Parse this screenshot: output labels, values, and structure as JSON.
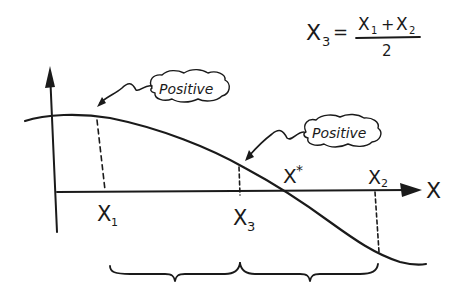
{
  "diagram": {
    "formula": {
      "lhs": "X",
      "lhs_sub": "3",
      "equals": "=",
      "numerator_a": "X",
      "numerator_a_sub": "1",
      "plus": "+",
      "numerator_b": "X",
      "numerator_b_sub": "2",
      "denominator": "2"
    },
    "axis": {
      "x_label": "X"
    },
    "points": {
      "x1": {
        "label": "X",
        "sub": "1"
      },
      "x3": {
        "label": "X",
        "sub": "3"
      },
      "x2": {
        "label": "X",
        "sub": "2"
      },
      "root": {
        "label": "X",
        "sup": "*"
      }
    },
    "callouts": [
      {
        "text": "Positive",
        "target": "f(x1)"
      },
      {
        "text": "Positive",
        "target": "f(x3)"
      }
    ],
    "braces": [
      {
        "from": "x1",
        "to": "x3"
      },
      {
        "from": "x3",
        "to": "x2"
      }
    ],
    "colors": {
      "ink": "#1a1a1a",
      "background": "#ffffff"
    }
  }
}
